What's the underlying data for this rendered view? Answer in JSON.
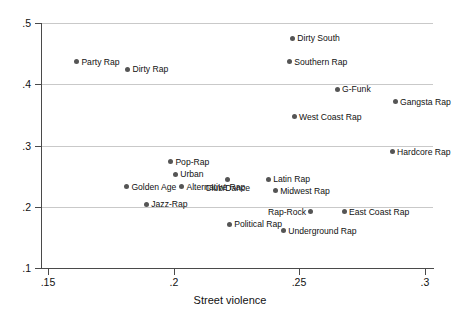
{
  "chart_data": {
    "type": "scatter",
    "title": "",
    "xlabel": "Street violence",
    "ylabel": "Swagger",
    "xlim": [
      0.15,
      0.3
    ],
    "ylim": [
      0.1,
      0.5
    ],
    "xticks": [
      ".15",
      ".2",
      ".25",
      ".3"
    ],
    "xtick_values": [
      0.15,
      0.2,
      0.25,
      0.3
    ],
    "yticks": [
      ".1",
      ".2",
      ".3",
      ".4",
      ".5"
    ],
    "ytick_values": [
      0.1,
      0.2,
      0.3,
      0.4,
      0.5
    ],
    "grid": "horizontal",
    "legend": "none",
    "marker_color": "#555555",
    "grid_color": "#c9c9c9",
    "axis_color": "#4a4a4a",
    "points": [
      {
        "label": "Party Rap",
        "x": 0.1615,
        "y": 0.4367,
        "label_pos": "right"
      },
      {
        "label": "Dirty Rap",
        "x": 0.1818,
        "y": 0.4245,
        "label_pos": "right"
      },
      {
        "label": "Dirty South",
        "x": 0.2474,
        "y": 0.4755,
        "label_pos": "right"
      },
      {
        "label": "Southern Rap",
        "x": 0.2462,
        "y": 0.4367,
        "label_pos": "right"
      },
      {
        "label": "G-Funk",
        "x": 0.2652,
        "y": 0.3918,
        "label_pos": "right"
      },
      {
        "label": "Gangsta Rap",
        "x": 0.2883,
        "y": 0.3714,
        "label_pos": "right"
      },
      {
        "label": "West Coast Rap",
        "x": 0.2481,
        "y": 0.3469,
        "label_pos": "right"
      },
      {
        "label": "Hardcore Rap",
        "x": 0.2871,
        "y": 0.2898,
        "label_pos": "right"
      },
      {
        "label": "Pop-Rap",
        "x": 0.1989,
        "y": 0.2735,
        "label_pos": "right"
      },
      {
        "label": "Urban",
        "x": 0.2008,
        "y": 0.2531,
        "label_pos": "right"
      },
      {
        "label": "Club/Dance",
        "x": 0.2215,
        "y": 0.2449,
        "label_pos": "below"
      },
      {
        "label": "Latin Rap",
        "x": 0.2378,
        "y": 0.2449,
        "label_pos": "right"
      },
      {
        "label": "Midwest Rap",
        "x": 0.2406,
        "y": 0.2265,
        "label_pos": "right"
      },
      {
        "label": "Rap-Rock",
        "x": 0.2545,
        "y": 0.1918,
        "label_pos": "left"
      },
      {
        "label": "East Coast Rap",
        "x": 0.268,
        "y": 0.1918,
        "label_pos": "right"
      },
      {
        "label": "Underground Rap",
        "x": 0.2438,
        "y": 0.1612,
        "label_pos": "right"
      },
      {
        "label": "Golden Age",
        "x": 0.1814,
        "y": 0.2327,
        "label_pos": "right"
      },
      {
        "label": "Alternative Rap",
        "x": 0.2033,
        "y": 0.2327,
        "label_pos": "right"
      },
      {
        "label": "Jazz-Rap",
        "x": 0.1893,
        "y": 0.2041,
        "label_pos": "right"
      },
      {
        "label": "Political Rap",
        "x": 0.2223,
        "y": 0.1714,
        "label_pos": "right"
      }
    ]
  }
}
